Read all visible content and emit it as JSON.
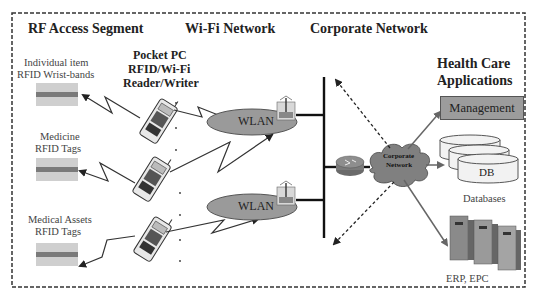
{
  "segments": {
    "rf_access": "RF Access Segment",
    "wifi": "Wi-Fi Network",
    "corporate": "Corporate Network"
  },
  "health_care": {
    "title_line1": "Health Care",
    "title_line2": "Applications",
    "management": "Management",
    "db": "DB",
    "databases": "Databases",
    "erp": "ERP, EPC"
  },
  "pocket_pc": {
    "line1": "Pocket PC",
    "line2": "RFID/Wi-Fi",
    "line3": "Reader/Writer"
  },
  "tags": [
    {
      "line1": "Individual item",
      "line2": "RFID Wrist-bands"
    },
    {
      "line1": "Medicine",
      "line2": "RFID Tags"
    },
    {
      "line1": "Medical Assets",
      "line2": "RFID Tags"
    }
  ],
  "wlan": [
    "WLAN",
    "WLAN"
  ],
  "cloud": {
    "line1": "Corporate",
    "line2": "Network"
  },
  "colors": {
    "border": "#333333",
    "ellipse": "#9a9a9a",
    "tag_bg": "#c8c8c8",
    "tag_stripe": "#777777",
    "management_fill": "#9c9c9c",
    "cloud": "#808080"
  }
}
